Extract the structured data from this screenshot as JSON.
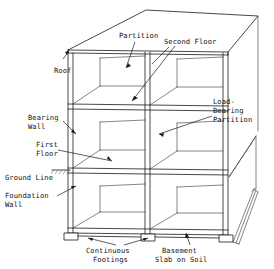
{
  "diagram": {
    "type": "architectural-axonometric",
    "stroke_color": "#1a1a1a",
    "background_color": "#ffffff",
    "structure": {
      "bays": 2,
      "levels": 3,
      "level_names": [
        "Second Floor",
        "First Floor",
        "Basement"
      ]
    }
  },
  "labels": {
    "partition": "Partition",
    "second_floor": "Second Floor",
    "roof": "Roof",
    "bearing_wall_line1": "Bearing",
    "bearing_wall_line2": "Wall",
    "first_floor_line1": "First",
    "first_floor_line2": "Floor",
    "ground_line": "Ground Line",
    "foundation_wall_line1": "Foundation",
    "foundation_wall_line2": "Wall",
    "load_bearing_line1": "Load-",
    "load_bearing_line2": "Bearing",
    "load_bearing_line3": "Partition",
    "continuous_footings_line1": "Continuous",
    "continuous_footings_line2": "Footings",
    "basement_slab_line1": "Basement",
    "basement_slab_line2": "Slab on Soil"
  }
}
